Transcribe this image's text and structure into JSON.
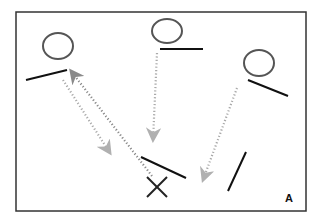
{
  "figure": {
    "panel_label": "A",
    "colors": {
      "frame": "#333333",
      "circle": "#555555",
      "line": "#111111",
      "arrow": "#aaaaaa",
      "arrow_dark": "#888888",
      "cross": "#222222"
    },
    "frame": {
      "x": 16,
      "y": 12,
      "w": 290,
      "h": 199
    },
    "circles": [
      {
        "cx": 58,
        "cy": 46,
        "rx": 15,
        "ry": 13
      },
      {
        "cx": 167,
        "cy": 31,
        "rx": 15,
        "ry": 12
      },
      {
        "cx": 259,
        "cy": 63,
        "rx": 15,
        "ry": 13
      }
    ],
    "lines": [
      {
        "x1": 26,
        "y1": 80,
        "x2": 67,
        "y2": 70
      },
      {
        "x1": 160,
        "y1": 49,
        "x2": 203,
        "y2": 49
      },
      {
        "x1": 248,
        "y1": 80,
        "x2": 288,
        "y2": 96
      },
      {
        "x1": 141,
        "y1": 157,
        "x2": 186,
        "y2": 178
      },
      {
        "x1": 228,
        "y1": 191,
        "x2": 246,
        "y2": 152
      }
    ],
    "cross": {
      "cx": 157,
      "cy": 187,
      "size": 10
    },
    "arrows": [
      {
        "x1": 63,
        "y1": 80,
        "x2": 110,
        "y2": 153,
        "style": "light"
      },
      {
        "x1": 157,
        "y1": 53,
        "x2": 153,
        "y2": 140,
        "style": "light"
      },
      {
        "x1": 237,
        "y1": 88,
        "x2": 203,
        "y2": 180,
        "style": "light"
      },
      {
        "x1": 152,
        "y1": 176,
        "x2": 71,
        "y2": 71,
        "style": "dark"
      }
    ]
  }
}
